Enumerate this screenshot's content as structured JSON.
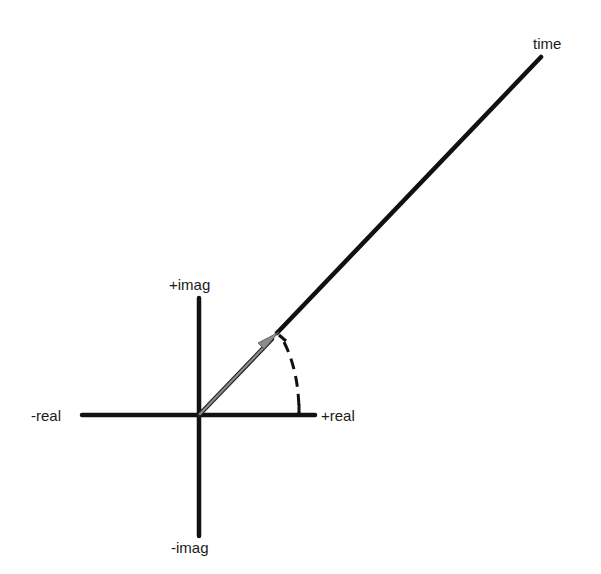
{
  "diagram": {
    "title": "",
    "labels": {
      "time": "time",
      "pos_imag": "+imag",
      "neg_imag": "-imag",
      "neg_real": "-real",
      "pos_real": "+real"
    },
    "colors": {
      "axis": "#111111",
      "helix_line": "#111111",
      "phasor": "#8c8c8c",
      "dashed_arc": "#111111",
      "text": "#1a1a1a",
      "background": "#ffffff"
    }
  }
}
